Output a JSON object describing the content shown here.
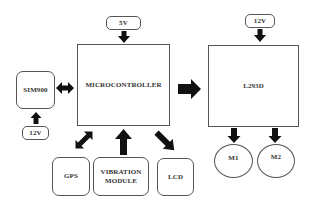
{
  "diagram": {
    "type": "block-diagram",
    "nodes": {
      "power_5v": {
        "label": "5V"
      },
      "microcontroller": {
        "label": "MICROCONTROLLER"
      },
      "power_12v_driver": {
        "label": "12V"
      },
      "l293d": {
        "label": "L293D"
      },
      "sim900": {
        "label": "SIM900"
      },
      "power_12v_sim": {
        "label": "12V"
      },
      "gps": {
        "label": "GPS"
      },
      "vibration_module": {
        "label": "VIBRATION\nMODULE"
      },
      "lcd": {
        "label": "LCD"
      },
      "m1": {
        "label": "M1"
      },
      "m2": {
        "label": "M2"
      }
    },
    "edges": [
      {
        "from": "5V",
        "to": "MICROCONTROLLER",
        "direction": "one-way"
      },
      {
        "from": "SIM900",
        "to": "MICROCONTROLLER",
        "direction": "bidirectional"
      },
      {
        "from": "12V",
        "to": "SIM900",
        "direction": "one-way"
      },
      {
        "from": "MICROCONTROLLER",
        "to": "L293D",
        "direction": "one-way"
      },
      {
        "from": "12V",
        "to": "L293D",
        "direction": "one-way"
      },
      {
        "from": "GPS",
        "to": "MICROCONTROLLER",
        "direction": "bidirectional"
      },
      {
        "from": "VIBRATION MODULE",
        "to": "MICROCONTROLLER",
        "direction": "one-way"
      },
      {
        "from": "MICROCONTROLLER",
        "to": "LCD",
        "direction": "one-way"
      },
      {
        "from": "L293D",
        "to": "M1",
        "direction": "one-way"
      },
      {
        "from": "L293D",
        "to": "M2",
        "direction": "one-way"
      }
    ],
    "colors": {
      "border": "#555555",
      "arrow": "#111111",
      "text": "#333333",
      "background": "#ffffff"
    }
  }
}
